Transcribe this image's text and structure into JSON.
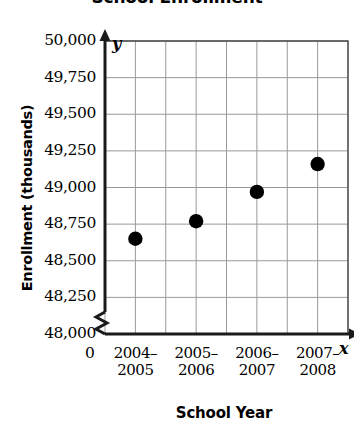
{
  "chart_data": {
    "type": "scatter",
    "title": "School Enrollment",
    "xlabel": "School Year",
    "ylabel": "Enrollment (thousands)",
    "x_axis_letter": "x",
    "y_axis_letter": "y",
    "origin_label": "0",
    "categories": [
      "2004–2005",
      "2005–2006",
      "2006–2007",
      "2007–2008"
    ],
    "category_lines": [
      [
        "2004–",
        "2005"
      ],
      [
        "2005–",
        "2006"
      ],
      [
        "2006–",
        "2007"
      ],
      [
        "2007–",
        "2008"
      ]
    ],
    "values": [
      48650,
      48770,
      48970,
      49160
    ],
    "ylim": [
      48000,
      50000
    ],
    "ytick_step": 250,
    "ytick_labels": [
      "50,000",
      "49,750",
      "49,500",
      "49,250",
      "49,000",
      "48,750",
      "48,500",
      "48,250",
      "48,000"
    ],
    "ytick_values": [
      50000,
      49750,
      49500,
      49250,
      49000,
      48750,
      48500,
      48250,
      48000
    ],
    "grid": true,
    "legend": "none",
    "axis_break": true,
    "marker_color": "#000000",
    "grid_color": "#999999",
    "axis_color": "#1a1a1a"
  }
}
